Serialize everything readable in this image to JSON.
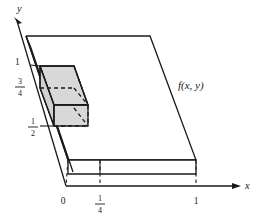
{
  "figure": {
    "type": "3d-diagram",
    "background_color": "#ffffff",
    "line_color": "#1a1a1a",
    "shade_color": "#d8d8d8",
    "axes": {
      "x_label": "x",
      "y_label": "y",
      "x_ticks": [
        {
          "label": "0",
          "value": 0
        },
        {
          "label_numerator": "1",
          "label_denominator": "4",
          "value": 0.25
        },
        {
          "label": "1",
          "value": 1
        }
      ],
      "y_ticks": [
        {
          "label": "1",
          "value": 1
        },
        {
          "label_numerator": "3",
          "label_denominator": "4",
          "value": 0.75
        },
        {
          "label_numerator": "1",
          "label_denominator": "2",
          "value": 0.5
        }
      ]
    },
    "function_label": "f(x, y)"
  }
}
